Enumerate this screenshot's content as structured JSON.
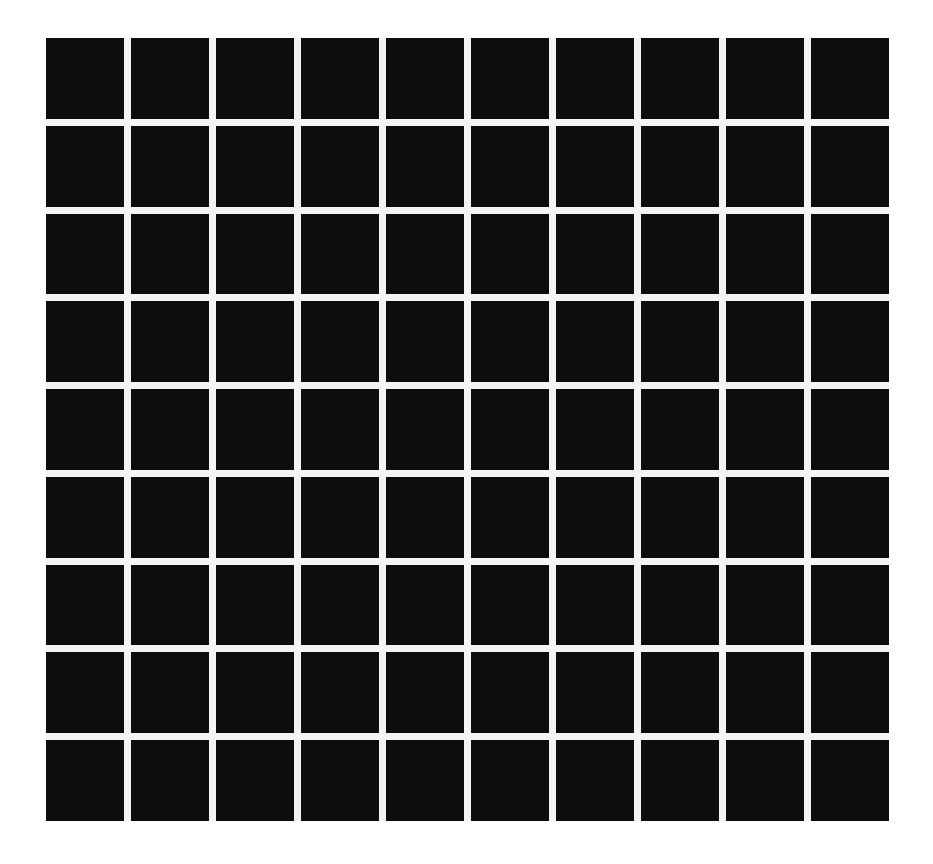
{
  "figure": {
    "type": "grid-illusion",
    "rows": 9,
    "columns": 10,
    "cell_color": "#0d0d0d",
    "gap_color": "#f4f4f4",
    "background_color": "#ffffff"
  }
}
